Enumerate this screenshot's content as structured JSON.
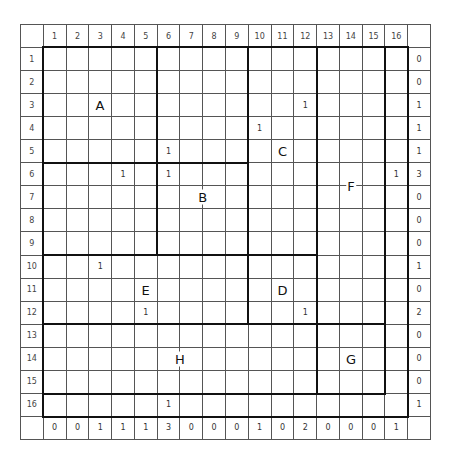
{
  "puzzle": {
    "col_headers": [
      "1",
      "2",
      "3",
      "4",
      "5",
      "6",
      "7",
      "8",
      "9",
      "10",
      "11",
      "12",
      "13",
      "14",
      "15",
      "16"
    ],
    "row_headers": [
      "1",
      "2",
      "3",
      "4",
      "5",
      "6",
      "7",
      "8",
      "9",
      "10",
      "11",
      "12",
      "13",
      "14",
      "15",
      "16"
    ],
    "row_sums": [
      "0",
      "0",
      "1",
      "1",
      "1",
      "3",
      "0",
      "0",
      "0",
      "1",
      "0",
      "2",
      "0",
      "0",
      "0",
      "1"
    ],
    "col_sums": [
      "0",
      "0",
      "1",
      "1",
      "1",
      "3",
      "0",
      "0",
      "0",
      "1",
      "0",
      "2",
      "0",
      "0",
      "0",
      "1"
    ],
    "numbers": [
      {
        "r": 3,
        "c": 12,
        "v": "1"
      },
      {
        "r": 4,
        "c": 10,
        "v": "1"
      },
      {
        "r": 5,
        "c": 6,
        "v": "1"
      },
      {
        "r": 6,
        "c": 4,
        "v": "1"
      },
      {
        "r": 6,
        "c": 6,
        "v": "1"
      },
      {
        "r": 6,
        "c": 16,
        "v": "1"
      },
      {
        "r": 10,
        "c": 3,
        "v": "1"
      },
      {
        "r": 12,
        "c": 5,
        "v": "1"
      },
      {
        "r": 12,
        "c": 12,
        "v": "1"
      },
      {
        "r": 16,
        "c": 6,
        "v": "1"
      }
    ],
    "region_labels": [
      {
        "r": 3,
        "c": 3,
        "v": "A"
      },
      {
        "r": 7,
        "c": 7.5,
        "v": "B"
      },
      {
        "r": 5,
        "c": 11,
        "v": "C"
      },
      {
        "r": 11,
        "c": 11,
        "v": "D"
      },
      {
        "r": 11,
        "c": 5,
        "v": "E"
      },
      {
        "r": 6.5,
        "c": 14,
        "v": "F"
      },
      {
        "r": 14,
        "c": 14,
        "v": "G"
      },
      {
        "r": 14,
        "c": 6.5,
        "v": "H"
      }
    ],
    "thick_h": [
      {
        "row": 0,
        "c1": 1,
        "c2": 16
      },
      {
        "row": 5,
        "c1": 1,
        "c2": 9
      },
      {
        "row": 9,
        "c1": 1,
        "c2": 9
      },
      {
        "row": 9,
        "c1": 10,
        "c2": 12
      },
      {
        "row": 12,
        "c1": 1,
        "c2": 15
      },
      {
        "row": 15,
        "c1": 1,
        "c2": 15
      },
      {
        "row": 16,
        "c1": 1,
        "c2": 16
      }
    ],
    "thick_v": [
      {
        "col": 0,
        "r1": 1,
        "r2": 16
      },
      {
        "col": 5,
        "r1": 1,
        "r2": 9
      },
      {
        "col": 9,
        "r1": 1,
        "r2": 12
      },
      {
        "col": 12,
        "r1": 1,
        "r2": 15
      },
      {
        "col": 15,
        "r1": 1,
        "r2": 15
      },
      {
        "col": 16,
        "r1": 1,
        "r2": 16
      }
    ]
  }
}
